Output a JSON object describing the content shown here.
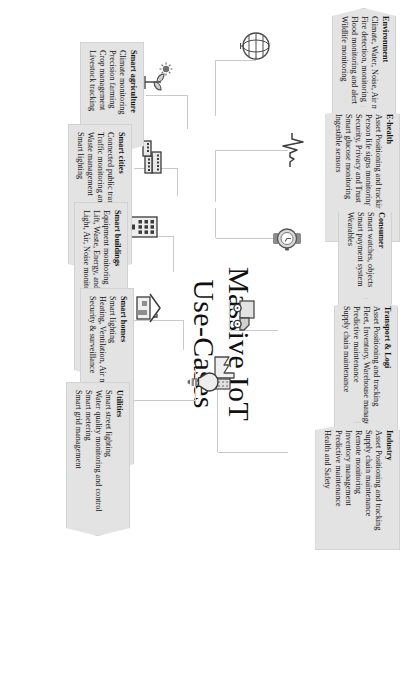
{
  "diagram": {
    "title_line1": "Massive IoT",
    "title_line2": "Use-Cases",
    "accent": "#e3e3e3",
    "line_color": "#c9c9c9",
    "text_color": "#111111"
  },
  "categories": [
    {
      "id": "environment",
      "heading": "Environment",
      "icon": "globe-icon",
      "items": [
        "Climate, Water, Noise, Air monitoring",
        "Fire detection, monitoring",
        "Flood monitoring and alert",
        "Wildlife monitoring"
      ]
    },
    {
      "id": "e-health",
      "heading": "E-health",
      "icon": "heartbeat-icon",
      "items": [
        "Asset Positioning and tracking",
        "Person life signs monitoring",
        "Security, Privacy and Trust",
        "Smart glucose monitoring",
        "Ingestible sensors"
      ]
    },
    {
      "id": "consumer",
      "heading": "Consumer",
      "icon": "smartwatch-icon",
      "items": [
        "Smart watches, objects",
        "Smart payment system",
        "Wearables"
      ]
    },
    {
      "id": "transport-logi",
      "heading": "Transport & Logi",
      "icon": "truck-icon",
      "items": [
        "Asset Positioning and tracking",
        "Fleet, Inventory, Warehouse management",
        "Predictive maintenance",
        "Supply chain maintenance"
      ]
    },
    {
      "id": "industry",
      "heading": "Industry",
      "icon": "factory-icon",
      "items": [
        "Asset Positioning and tracking",
        "Supply chain maintenance",
        "Remote monitoring",
        "Inventory management",
        "Predictive maintenance",
        "Health and Safety"
      ]
    },
    {
      "id": "smart-agriculture",
      "heading": "Smart agriculture",
      "icon": "plant-sun-icon",
      "items": [
        "Climate monitoring",
        "Precision farming",
        "Crop management",
        "Livestock tracking"
      ]
    },
    {
      "id": "smart-cities",
      "heading": "Smart cities",
      "icon": "cityscape-icon",
      "items": [
        "Connected public transport",
        "Traffic monitoring and management",
        "Waste management",
        "Smart lighting"
      ]
    },
    {
      "id": "smart-buildings",
      "heading": "Smart buildings",
      "icon": "building-icon",
      "items": [
        "Equipment monitoring",
        "Lift, Waste, Energy, and Space management",
        "Light, Air, Noise monitoring"
      ]
    },
    {
      "id": "smart-homes",
      "heading": "Smart homes",
      "icon": "house-icon",
      "items": [
        "Smart lighting",
        "Heating, Ventilation, Air monitoring & control",
        "Security & surveillance"
      ]
    },
    {
      "id": "utilities",
      "heading": "Utilities",
      "icon": "lightbulb-icon",
      "items": [
        "Smart street lighting",
        "Water quality monitoring and control",
        "Smart metering",
        "Smart grid management"
      ]
    }
  ]
}
